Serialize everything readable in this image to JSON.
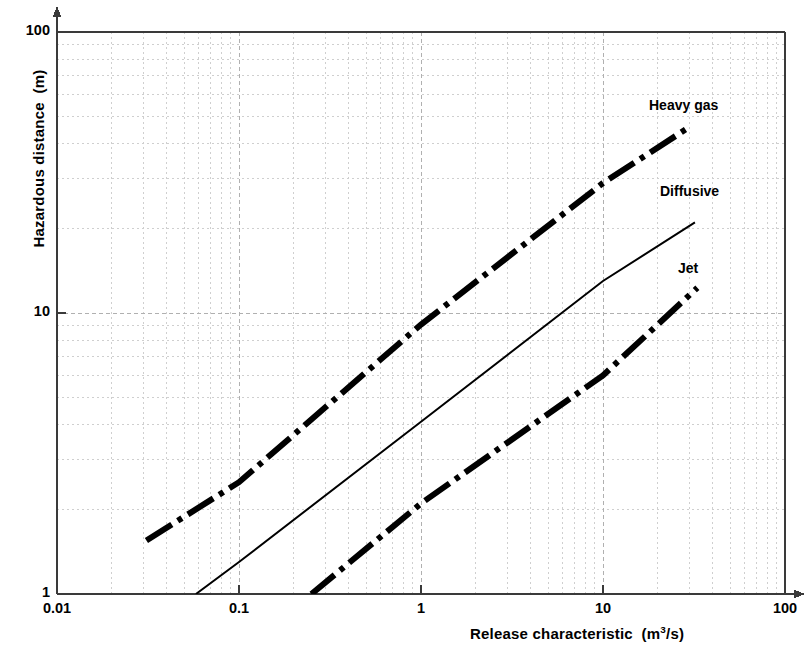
{
  "chart_data": {
    "type": "line",
    "title": "",
    "subtitle": "",
    "xlabel": "Release characteristic",
    "xunits": "(m3/s)",
    "ylabel": "Hazardous distance",
    "yunits": "(m)",
    "xscale": "log",
    "yscale": "log",
    "xlim": [
      0.01,
      100
    ],
    "ylim": [
      1,
      100
    ],
    "grid": "on",
    "minor_grid": "on",
    "legend_position": "inline-right-of-each-curve",
    "xticks": [
      "0.01",
      "0.1",
      "1",
      "10",
      "100"
    ],
    "xtick_values": [
      0.01,
      0.1,
      1,
      10,
      100
    ],
    "yticks": [
      "1",
      "10",
      "100"
    ],
    "ytick_values": [
      1,
      10,
      100
    ],
    "series": [
      {
        "name": "Heavy gas",
        "label": "Heavy gas",
        "style": "thick-dash-dot",
        "color": "#000000",
        "linewidth": 6,
        "x": [
          0.031,
          30
        ],
        "y": [
          1.55,
          46
        ],
        "points": [
          {
            "x": 0.031,
            "y": 1.55
          },
          {
            "x": 0.1,
            "y": 2.5
          },
          {
            "x": 1.0,
            "y": 9.1
          },
          {
            "x": 10.0,
            "y": 29.0
          },
          {
            "x": 30.0,
            "y": 46.0
          }
        ]
      },
      {
        "name": "Diffusive",
        "label": "Diffusive",
        "style": "thin-solid",
        "color": "#000000",
        "linewidth": 2,
        "x": [
          0.058,
          32
        ],
        "y": [
          1.0,
          21.0
        ],
        "points": [
          {
            "x": 0.058,
            "y": 1.0
          },
          {
            "x": 0.1,
            "y": 1.3
          },
          {
            "x": 1.0,
            "y": 4.1
          },
          {
            "x": 10.0,
            "y": 13.0
          },
          {
            "x": 32.0,
            "y": 21.0
          }
        ]
      },
      {
        "name": "Jet",
        "label": "Jet",
        "style": "thick-dash-dot",
        "color": "#000000",
        "linewidth": 6,
        "x": [
          0.25,
          33
        ],
        "y": [
          1.0,
          12.3
        ],
        "points": [
          {
            "x": 0.25,
            "y": 1.0
          },
          {
            "x": 1.0,
            "y": 2.1
          },
          {
            "x": 10.0,
            "y": 6.0
          },
          {
            "x": 33.0,
            "y": 12.3
          }
        ]
      }
    ],
    "annotations": [
      {
        "text": "Heavy gas",
        "x_px": 649,
        "y_px": 97
      },
      {
        "text": "Diffusive",
        "x_px": 660,
        "y_px": 183
      },
      {
        "text": "Jet",
        "x_px": 678,
        "y_px": 260
      }
    ]
  },
  "axes": {
    "y_title": "Hazardous distance",
    "y_units": "(m)",
    "x_title": "Release characteristic",
    "x_units_prefix": "(m",
    "x_units_sup": "3",
    "x_units_suffix": "/s)",
    "x_tick_labels": [
      "0.01",
      "0.1",
      "1",
      "10",
      "100"
    ],
    "y_tick_labels": [
      "100",
      "10",
      "1"
    ]
  },
  "colors": {
    "axis": "#3a3a3a",
    "grid_major": "#b0b0b0",
    "grid_minor": "#cfcfcf",
    "curve": "#000000",
    "text": "#000000",
    "background": "#ffffff"
  }
}
